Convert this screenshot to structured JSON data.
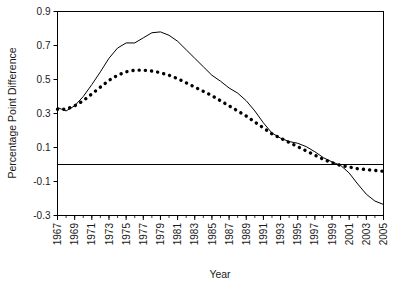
{
  "chart_data": {
    "type": "line",
    "title": "",
    "subtitle": "",
    "xlabel": "Year",
    "ylabel": "Percentage Point Difference",
    "xlim": [
      1967,
      2005
    ],
    "ylim": [
      -0.3,
      0.9
    ],
    "xticks": [
      1967,
      1969,
      1971,
      1973,
      1975,
      1977,
      1979,
      1981,
      1983,
      1985,
      1987,
      1989,
      1991,
      1993,
      1995,
      1997,
      1999,
      2001,
      2003,
      2005
    ],
    "xtick_labels": [
      "1967",
      "1969",
      "1971",
      "1973",
      "1975",
      "1977",
      "1979",
      "1981",
      "1983",
      "1985",
      "1987",
      "1989",
      "1991",
      "1993",
      "1995",
      "1997",
      "1999",
      "2001",
      "2003",
      "2005"
    ],
    "xtick_minor_every": 1,
    "yticks": [
      -0.3,
      -0.1,
      0.1,
      0.3,
      0.5,
      0.7,
      0.9
    ],
    "ytick_labels": [
      "-0.3",
      "-0.1",
      "0.1",
      "0.3",
      "0.5",
      "0.7",
      "0.9"
    ],
    "grid": false,
    "legend": "none",
    "zero_line": 0,
    "x": [
      1967,
      1968,
      1969,
      1970,
      1971,
      1972,
      1973,
      1974,
      1975,
      1976,
      1977,
      1978,
      1979,
      1980,
      1981,
      1982,
      1983,
      1984,
      1985,
      1986,
      1987,
      1988,
      1989,
      1990,
      1991,
      1992,
      1993,
      1994,
      1995,
      1996,
      1997,
      1998,
      1999,
      2000,
      2001,
      2002,
      2003,
      2004,
      2005
    ],
    "series": [
      {
        "name": "solid-line",
        "style": "solid",
        "color": "#000000",
        "values": [
          0.335,
          0.315,
          0.345,
          0.4,
          0.47,
          0.545,
          0.625,
          0.685,
          0.715,
          0.715,
          0.745,
          0.775,
          0.78,
          0.76,
          0.725,
          0.675,
          0.625,
          0.575,
          0.525,
          0.49,
          0.45,
          0.42,
          0.375,
          0.315,
          0.245,
          0.185,
          0.155,
          0.135,
          0.125,
          0.105,
          0.075,
          0.04,
          0.015,
          -0.005,
          -0.05,
          -0.115,
          -0.175,
          -0.215,
          -0.235
        ]
      },
      {
        "name": "dotted-line",
        "style": "dotted",
        "color": "#000000",
        "values": [
          0.325,
          0.325,
          0.345,
          0.375,
          0.415,
          0.455,
          0.495,
          0.525,
          0.545,
          0.555,
          0.555,
          0.55,
          0.54,
          0.525,
          0.505,
          0.48,
          0.455,
          0.43,
          0.405,
          0.375,
          0.345,
          0.315,
          0.285,
          0.25,
          0.215,
          0.18,
          0.155,
          0.13,
          0.105,
          0.08,
          0.055,
          0.03,
          0.01,
          -0.005,
          -0.015,
          -0.025,
          -0.03,
          -0.035,
          -0.04
        ]
      }
    ]
  },
  "axis": {
    "ylabel": "Percentage Point Difference",
    "xlabel": "Year"
  }
}
